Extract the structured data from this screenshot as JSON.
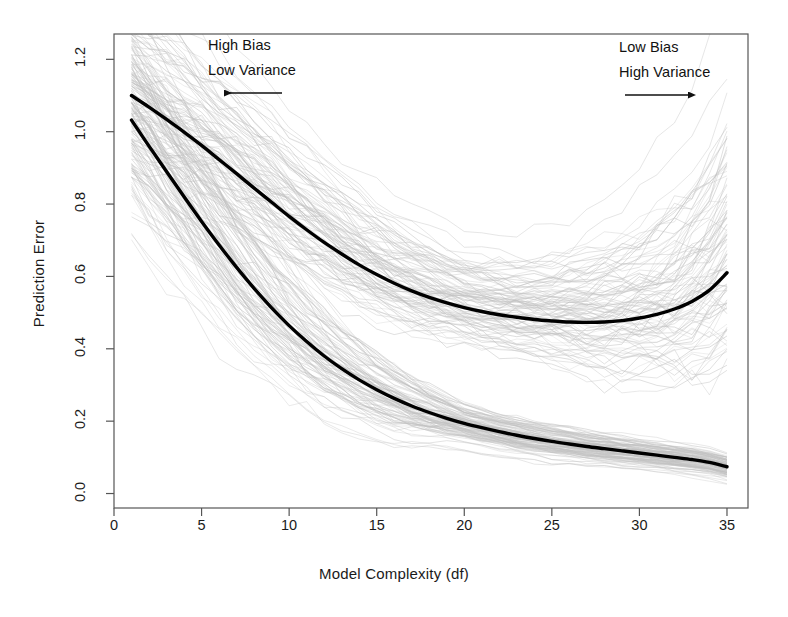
{
  "chart_data": {
    "type": "line",
    "title": "",
    "subtitle": "",
    "xlabel": "Model Complexity (df)",
    "ylabel": "Prediction Error",
    "xlim": [
      0,
      36.2
    ],
    "ylim": [
      -0.04,
      1.27
    ],
    "xticks": [
      0,
      5,
      10,
      15,
      20,
      25,
      30,
      35
    ],
    "xticklabels": [
      "0",
      "5",
      "10",
      "15",
      "20",
      "25",
      "30",
      "35"
    ],
    "yticks": [
      0.0,
      0.2,
      0.4,
      0.6,
      0.8,
      1.0,
      1.2
    ],
    "yticklabels": [
      "0.0",
      "0.2",
      "0.4",
      "0.6",
      "0.8",
      "1.0",
      "1.2"
    ],
    "grid": false,
    "legend": null,
    "legend_position": "none",
    "x": [
      1,
      2,
      3,
      4,
      5,
      6,
      7,
      8,
      9,
      10,
      11,
      12,
      13,
      14,
      15,
      16,
      17,
      18,
      19,
      20,
      21,
      22,
      23,
      24,
      25,
      26,
      27,
      28,
      29,
      30,
      31,
      32,
      33,
      34,
      35
    ],
    "series": [
      {
        "name": "Expected test error (bold upper curve)",
        "role": "mean-test-error",
        "color": "#000000",
        "linewidth": 3.4,
        "values": [
          1.1,
          1.068,
          1.034,
          0.999,
          0.962,
          0.923,
          0.884,
          0.844,
          0.805,
          0.766,
          0.729,
          0.694,
          0.662,
          0.632,
          0.605,
          0.581,
          0.56,
          0.542,
          0.527,
          0.514,
          0.503,
          0.494,
          0.487,
          0.481,
          0.477,
          0.474,
          0.473,
          0.474,
          0.478,
          0.485,
          0.495,
          0.51,
          0.531,
          0.562,
          0.61
        ]
      },
      {
        "name": "Expected training error (bold lower curve)",
        "role": "mean-training-error",
        "color": "#000000",
        "linewidth": 3.4,
        "values": [
          1.032,
          0.96,
          0.89,
          0.82,
          0.752,
          0.687,
          0.625,
          0.567,
          0.513,
          0.464,
          0.42,
          0.38,
          0.345,
          0.314,
          0.287,
          0.263,
          0.242,
          0.224,
          0.208,
          0.194,
          0.182,
          0.171,
          0.161,
          0.152,
          0.144,
          0.137,
          0.13,
          0.124,
          0.118,
          0.112,
          0.106,
          0.1,
          0.094,
          0.086,
          0.074
        ]
      }
    ],
    "light_curve_bands": [
      {
        "name": "Test error samples (100 light gray curves)",
        "role": "test-error-samples",
        "color": "#c0c0c0",
        "count": 100,
        "spread_at_df1": [
          0.72,
          1.26
        ],
        "spread_at_df20": [
          0.3,
          0.84
        ],
        "spread_at_df35": [
          0.36,
          1.14
        ]
      },
      {
        "name": "Training error samples (100 light gray curves)",
        "role": "training-error-samples",
        "color": "#c0c0c0",
        "count": 100,
        "spread_at_df1": [
          0.66,
          1.22
        ],
        "spread_at_df20": [
          0.12,
          0.3
        ],
        "spread_at_df35": [
          0.03,
          0.16
        ]
      }
    ],
    "annotations": [
      {
        "id": "high-bias-low-variance",
        "lines": [
          "High Bias",
          "Low Variance"
        ],
        "arrow": "left",
        "x_data": 5.0,
        "y_data": 1.085
      },
      {
        "id": "low-bias-high-variance",
        "lines": [
          "Low Bias",
          "High Variance"
        ],
        "arrow": "right",
        "x_data": 31.5,
        "y_data": 1.085
      }
    ]
  },
  "annotations": {
    "left": {
      "line1": "High Bias",
      "line2": "Low Variance",
      "arrow_direction": "left"
    },
    "right": {
      "line1": "Low Bias",
      "line2": "High Variance",
      "arrow_direction": "right"
    }
  },
  "axes": {
    "x_title": "Model Complexity (df)",
    "y_title": "Prediction Error",
    "x_labels": [
      "0",
      "5",
      "10",
      "15",
      "20",
      "25",
      "30",
      "35"
    ],
    "y_labels": [
      "0.0",
      "0.2",
      "0.4",
      "0.6",
      "0.8",
      "1.0",
      "1.2"
    ]
  },
  "colors": {
    "background": "#ffffff",
    "axis": "#555555",
    "bold_curve": "#000000",
    "sample_curve": "#c0c0c0",
    "text": "#1a1a1a"
  }
}
